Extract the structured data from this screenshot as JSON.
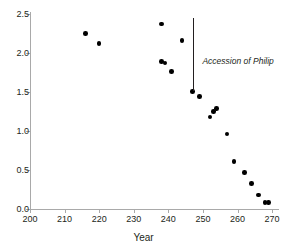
{
  "chart_data": {
    "type": "scatter",
    "title": "",
    "xlabel": "Year",
    "ylabel": "",
    "xlim": [
      200,
      272
    ],
    "ylim": [
      0.0,
      2.5
    ],
    "xticks": [
      200,
      210,
      220,
      230,
      240,
      250,
      260,
      270
    ],
    "yticks": [
      "0.0",
      "0.5",
      "1.0",
      "1.5",
      "2.0",
      "2.5"
    ],
    "ytick_values": [
      0.0,
      0.5,
      1.0,
      1.5,
      2.0,
      2.5
    ],
    "grid": false,
    "legend": null,
    "points": [
      {
        "x": 216,
        "y": 2.25
      },
      {
        "x": 220,
        "y": 2.12
      },
      {
        "x": 238,
        "y": 2.37
      },
      {
        "x": 244,
        "y": 2.16
      },
      {
        "x": 238,
        "y": 1.89
      },
      {
        "x": 239,
        "y": 1.87
      },
      {
        "x": 241,
        "y": 1.76
      },
      {
        "x": 247,
        "y": 1.51
      },
      {
        "x": 249,
        "y": 1.44
      },
      {
        "x": 253,
        "y": 1.25
      },
      {
        "x": 254,
        "y": 1.29
      },
      {
        "x": 252,
        "y": 1.18
      },
      {
        "x": 257,
        "y": 0.96
      },
      {
        "x": 259,
        "y": 0.61
      },
      {
        "x": 262,
        "y": 0.47
      },
      {
        "x": 264,
        "y": 0.33
      },
      {
        "x": 266,
        "y": 0.18
      },
      {
        "x": 268,
        "y": 0.08
      },
      {
        "x": 269,
        "y": 0.08
      }
    ],
    "annotations": [
      {
        "text": "Accession of Philip",
        "x": 247,
        "y_top": 2.45,
        "y_bottom": 1.51,
        "label_x": 249,
        "label_y": 1.88
      }
    ]
  }
}
